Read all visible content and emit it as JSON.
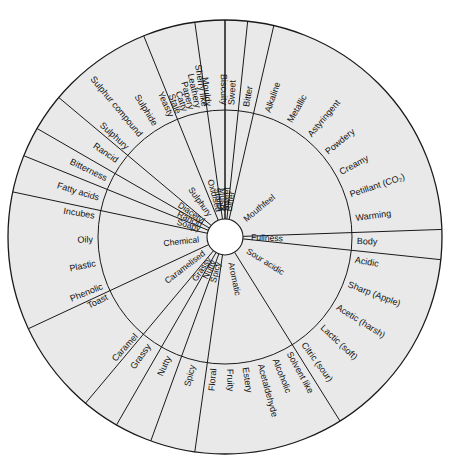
{
  "diagram": {
    "type": "flavour-wheel",
    "geometry": {
      "cx": 225,
      "cy": 237,
      "hub_radius": 18,
      "mid_radius": 127,
      "outer_radius": 217,
      "rotation_offset_deg": -90
    },
    "colors": {
      "sector_fill": "#e9e9e9",
      "stroke": "#1a1a1a",
      "hub_fill": "#ffffff",
      "background": "#ffffff",
      "text": "#111111"
    },
    "sectors": [
      {
        "inner_label": "Sweet",
        "start_deg": 0,
        "end_deg": 6,
        "outer_labels": [
          "Sweet"
        ]
      },
      {
        "inner_label": "Bitter",
        "start_deg": 6,
        "end_deg": 13,
        "outer_labels": [
          "Bitter"
        ]
      },
      {
        "inner_label": "Mouthfeel",
        "start_deg": 13,
        "end_deg": 88,
        "outer_labels": [
          "Alkaline",
          "Metallic",
          "Astyringent",
          "Powdery",
          "Creamy",
          "Petillant (CO₂)",
          "Warming"
        ]
      },
      {
        "inner_label": "Fullness",
        "start_deg": 88,
        "end_deg": 96,
        "outer_labels": [
          "Body"
        ]
      },
      {
        "inner_label": "Sour acidic",
        "start_deg": 96,
        "end_deg": 148,
        "outer_labels": [
          "Acidic",
          "Sharp (Apple)",
          "Acetic (harsh)",
          "Lactic (soft)",
          "Citric (sour)"
        ]
      },
      {
        "inner_label": "Aromatic",
        "start_deg": 148,
        "end_deg": 188,
        "outer_labels": [
          "Solvent like",
          "Alcoholic",
          "Acetaldehyde",
          "Estery",
          "Fruity",
          "Floral"
        ]
      },
      {
        "inner_label": "Spicy",
        "start_deg": 188,
        "end_deg": 200,
        "outer_labels": [
          "Spicy"
        ]
      },
      {
        "inner_label": "Nutty",
        "start_deg": 200,
        "end_deg": 210,
        "outer_labels": [
          "Nutty"
        ]
      },
      {
        "inner_label": "Grassy",
        "start_deg": 210,
        "end_deg": 220,
        "outer_labels": [
          "Grassy"
        ]
      },
      {
        "inner_label": "Caramelised",
        "start_deg": 220,
        "end_deg": 245,
        "outer_labels": [
          "Caramel",
          "Toast"
        ]
      },
      {
        "inner_label": "Chemical",
        "start_deg": 245,
        "end_deg": 282,
        "outer_labels": [
          "Phenolic",
          "Plastic",
          "Oily",
          "Incubes"
        ]
      },
      {
        "inner_label": "Soapy",
        "start_deg": 282,
        "end_deg": 292,
        "outer_labels": [
          "Fatty acids"
        ]
      },
      {
        "inner_label": "Rancid",
        "start_deg": 292,
        "end_deg": 300,
        "outer_labels": [
          "Bitterness"
        ]
      },
      {
        "inner_label": "Diacetyl",
        "start_deg": 300,
        "end_deg": 310,
        "outer_labels": [
          "Rancid"
        ]
      },
      {
        "inner_label": "Sulphury",
        "start_deg": 310,
        "end_deg": 338,
        "outer_labels": [
          "Sulphury",
          "Sulphur compound",
          "Sulphide",
          "Yeasty"
        ]
      },
      {
        "inner_label": "Oxidised",
        "inner_label_2": "Stales",
        "start_deg": 338,
        "end_deg": 352,
        "outer_labels": [
          "Stale",
          "Catty",
          "Papery",
          "Leathery",
          "Sherry like"
        ]
      },
      {
        "inner_label": "Musty",
        "start_deg": 352,
        "end_deg": 360,
        "outer_labels": [
          "Mouldy",
          "Biscuity"
        ]
      }
    ]
  }
}
